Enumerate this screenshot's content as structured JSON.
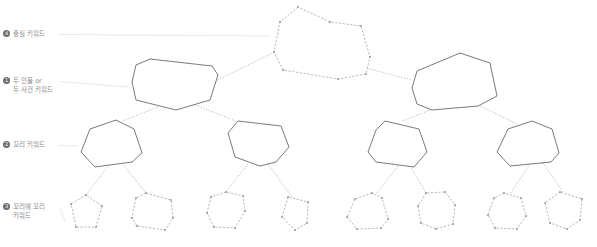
{
  "labels": [
    {
      "num": "4",
      "text": "중심 키워드",
      "text2": "",
      "x": 3,
      "y": 30,
      "line_to": [
        270,
        36
      ]
    },
    {
      "num": "1",
      "text": "두 인물 or",
      "text2": "두 사건 키워드",
      "x": 3,
      "y": 77,
      "line_to": [
        128,
        87
      ]
    },
    {
      "num": "2",
      "text": "꼬리 키워드",
      "text2": "",
      "x": 3,
      "y": 141,
      "line_to": [
        78,
        146
      ]
    },
    {
      "num": "3",
      "text": "꼬리에 꼬리",
      "text2": "키워드",
      "x": 3,
      "y": 203,
      "line_to": [
        65,
        221
      ]
    }
  ],
  "colors": {
    "solid_stroke": "#7a7a7a",
    "dashed_stroke": "#b0b0b0",
    "connector": "#b8b8b8",
    "leader": "#e2e2e2",
    "vertex": "#9a9a9a"
  },
  "nodes": {
    "center": {
      "style": "dashed",
      "points": [
        [
          298,
          7
        ],
        [
          280,
          22
        ],
        [
          274,
          52
        ],
        [
          283,
          70
        ],
        [
          338,
          79
        ],
        [
          366,
          74
        ],
        [
          370,
          57
        ],
        [
          361,
          26
        ],
        [
          330,
          22
        ]
      ]
    },
    "level1": [
      {
        "style": "solid",
        "points": [
          [
            150,
            59
          ],
          [
            136,
            65
          ],
          [
            132,
            82
          ],
          [
            136,
            100
          ],
          [
            176,
            110
          ],
          [
            210,
            100
          ],
          [
            218,
            75
          ],
          [
            212,
            66
          ]
        ]
      },
      {
        "style": "solid",
        "points": [
          [
            460,
            53
          ],
          [
            417,
            71
          ],
          [
            412,
            88
          ],
          [
            417,
            104
          ],
          [
            432,
            110
          ],
          [
            478,
            106
          ],
          [
            497,
            96
          ],
          [
            490,
            63
          ]
        ]
      }
    ],
    "level2": [
      {
        "style": "solid",
        "points": [
          [
            116,
            120
          ],
          [
            90,
            129
          ],
          [
            81,
            152
          ],
          [
            95,
            167
          ],
          [
            132,
            162
          ],
          [
            142,
            153
          ],
          [
            134,
            129
          ]
        ]
      },
      {
        "style": "solid",
        "points": [
          [
            238,
            121
          ],
          [
            228,
            133
          ],
          [
            235,
            157
          ],
          [
            260,
            166
          ],
          [
            276,
            162
          ],
          [
            289,
            147
          ],
          [
            281,
            126
          ]
        ]
      },
      {
        "style": "solid",
        "points": [
          [
            385,
            121
          ],
          [
            376,
            130
          ],
          [
            368,
            152
          ],
          [
            376,
            162
          ],
          [
            414,
            167
          ],
          [
            427,
            152
          ],
          [
            419,
            129
          ]
        ]
      },
      {
        "style": "solid",
        "points": [
          [
            532,
            121
          ],
          [
            508,
            129
          ],
          [
            497,
            152
          ],
          [
            510,
            166
          ],
          [
            551,
            162
          ],
          [
            559,
            153
          ],
          [
            552,
            129
          ]
        ]
      }
    ],
    "level3": [
      {
        "style": "dashed",
        "points": [
          [
            86,
            195
          ],
          [
            71,
            204
          ],
          [
            76,
            227
          ],
          [
            96,
            227
          ],
          [
            102,
            206
          ]
        ]
      },
      {
        "style": "dashed",
        "points": [
          [
            146,
            193
          ],
          [
            136,
            198
          ],
          [
            132,
            218
          ],
          [
            137,
            226
          ],
          [
            165,
            230
          ],
          [
            173,
            218
          ],
          [
            171,
            200
          ]
        ]
      },
      {
        "style": "dashed",
        "points": [
          [
            226,
            192
          ],
          [
            211,
            197
          ],
          [
            207,
            213
          ],
          [
            214,
            227
          ],
          [
            235,
            228
          ],
          [
            245,
            211
          ],
          [
            243,
            196
          ]
        ]
      },
      {
        "style": "dashed",
        "points": [
          [
            288,
            197
          ],
          [
            282,
            217
          ],
          [
            295,
            230
          ],
          [
            307,
            223
          ],
          [
            308,
            202
          ]
        ]
      },
      {
        "style": "dashed",
        "points": [
          [
            372,
            193
          ],
          [
            355,
            199
          ],
          [
            347,
            217
          ],
          [
            357,
            229
          ],
          [
            381,
            228
          ],
          [
            388,
            219
          ],
          [
            382,
            198
          ]
        ]
      },
      {
        "style": "dashed",
        "points": [
          [
            426,
            193
          ],
          [
            418,
            206
          ],
          [
            421,
            223
          ],
          [
            436,
            229
          ],
          [
            453,
            224
          ],
          [
            455,
            205
          ],
          [
            445,
            192
          ]
        ]
      },
      {
        "style": "dashed",
        "points": [
          [
            504,
            193
          ],
          [
            494,
            198
          ],
          [
            488,
            215
          ],
          [
            495,
            228
          ],
          [
            517,
            229
          ],
          [
            526,
            216
          ],
          [
            521,
            198
          ]
        ]
      },
      {
        "style": "dashed",
        "points": [
          [
            560,
            192
          ],
          [
            545,
            203
          ],
          [
            550,
            223
          ],
          [
            567,
            229
          ],
          [
            580,
            220
          ],
          [
            582,
            199
          ]
        ]
      }
    ]
  },
  "connectors": [
    [
      [
        274,
        52
      ],
      [
        218,
        80
      ]
    ],
    [
      [
        366,
        68
      ],
      [
        412,
        80
      ]
    ],
    [
      [
        158,
        107
      ],
      [
        122,
        121
      ]
    ],
    [
      [
        193,
        104
      ],
      [
        238,
        122
      ]
    ],
    [
      [
        433,
        109
      ],
      [
        402,
        121
      ]
    ],
    [
      [
        480,
        106
      ],
      [
        517,
        124
      ]
    ],
    [
      [
        109,
        165
      ],
      [
        86,
        195
      ]
    ],
    [
      [
        122,
        163
      ],
      [
        146,
        193
      ]
    ],
    [
      [
        248,
        164
      ],
      [
        226,
        192
      ]
    ],
    [
      [
        268,
        164
      ],
      [
        292,
        197
      ]
    ],
    [
      [
        398,
        166
      ],
      [
        376,
        194
      ]
    ],
    [
      [
        410,
        166
      ],
      [
        426,
        193
      ]
    ],
    [
      [
        530,
        164
      ],
      [
        510,
        194
      ]
    ],
    [
      [
        543,
        163
      ],
      [
        563,
        192
      ]
    ]
  ]
}
